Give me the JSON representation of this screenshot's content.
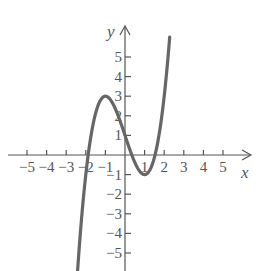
{
  "chart_data": {
    "type": "line",
    "title": "",
    "function": "x^3 - 3x + 1",
    "xlabel": "x",
    "ylabel": "y",
    "xlim": [
      -5.5,
      6.5
    ],
    "ylim": [
      -6,
      6.5
    ],
    "x_ticks": [
      -5,
      -4,
      -3,
      -2,
      -1,
      1,
      2,
      3,
      4,
      5
    ],
    "x_tick_labels": [
      "−5",
      "−4",
      "−3",
      "−2",
      "−1",
      "1",
      "2",
      "3",
      "4",
      "5"
    ],
    "y_ticks": [
      5,
      4,
      3,
      2,
      1,
      -1,
      -2,
      -3,
      -4,
      -5
    ],
    "y_tick_labels": [
      "5",
      "4",
      "3",
      "2",
      "1",
      "−1",
      "−2",
      "−3",
      "−4",
      "−5"
    ],
    "grid": false,
    "series": [
      {
        "name": "f(x)",
        "x_range": [
          -2.42,
          2.28
        ],
        "key_points": [
          {
            "x": -1,
            "y": 3,
            "label": "local max"
          },
          {
            "x": 1,
            "y": -1,
            "label": "local min"
          },
          {
            "x": 0,
            "y": 1,
            "label": "y-intercept"
          }
        ],
        "color": "#666666"
      }
    ]
  },
  "axes": {
    "x_label": "x",
    "y_label": "y"
  }
}
